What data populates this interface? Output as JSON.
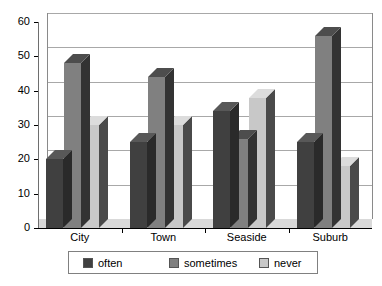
{
  "chart_data": {
    "type": "bar",
    "title": "",
    "subtitle": "",
    "xlabel": "",
    "ylabel": "",
    "categories": [
      "City",
      "Town",
      "Seaside",
      "Suburb"
    ],
    "series": [
      {
        "name": "often",
        "color": "#404040",
        "values": [
          20,
          25,
          34,
          25
        ]
      },
      {
        "name": "sometimes",
        "color": "#808080",
        "values": [
          48,
          44,
          26,
          56
        ]
      },
      {
        "name": "never",
        "color": "#c8c8c8",
        "values": [
          30,
          30,
          38,
          18
        ]
      }
    ],
    "ylim": [
      0,
      60
    ],
    "yticks": [
      0,
      10,
      20,
      30,
      40,
      50,
      60
    ],
    "ytick_labels": [
      "0",
      "10",
      "20",
      "30",
      "40",
      "50",
      "60"
    ],
    "grid": true,
    "grid_axis": "y",
    "legend_position": "bottom",
    "style": "3d-bar",
    "annotations": []
  },
  "legend": {
    "items": [
      {
        "label": "often"
      },
      {
        "label": "sometimes"
      },
      {
        "label": "never"
      }
    ]
  }
}
